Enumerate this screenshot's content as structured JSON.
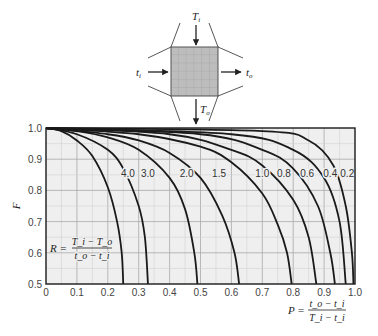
{
  "diagram": {
    "labels": {
      "top_in": "T_i",
      "bottom_out": "T_o",
      "left_in": "t_i",
      "right_out": "t_o"
    }
  },
  "chart_data": {
    "type": "line",
    "title": "",
    "xlabel": "P = (t_o − t_i) / (T_i − t_i)",
    "ylabel": "F",
    "xlim": [
      0,
      1.0
    ],
    "ylim": [
      0.5,
      1.0
    ],
    "grid": true,
    "xticks": [
      "0",
      "0.1",
      "0.2",
      "0.3",
      "0.4",
      "0.5",
      "0.6",
      "0.7",
      "0.8",
      "0.9",
      "1.0"
    ],
    "yticks": [
      "0.5",
      "0.6",
      "0.7",
      "0.8",
      "0.9",
      "1.0"
    ],
    "annotation": "R = (T_i − T_o) / (t_o − t_i)",
    "x_formula": {
      "lhs": "P =",
      "num": "t_o − t_i",
      "den": "T_i − t_i"
    },
    "r_formula": {
      "lhs": "R =",
      "num": "T_i − T_o",
      "den": "t_o − t_i"
    },
    "series": [
      {
        "name": "4.0",
        "label_pos": [
          0.265,
          0.855
        ],
        "points": [
          [
            0,
            1
          ],
          [
            0.05,
            0.99
          ],
          [
            0.1,
            0.96
          ],
          [
            0.15,
            0.91
          ],
          [
            0.2,
            0.81
          ],
          [
            0.23,
            0.7
          ],
          [
            0.245,
            0.6
          ],
          [
            0.25,
            0.5
          ]
        ]
      },
      {
        "name": "3.0",
        "label_pos": [
          0.33,
          0.855
        ],
        "points": [
          [
            0,
            1
          ],
          [
            0.1,
            0.98
          ],
          [
            0.2,
            0.93
          ],
          [
            0.25,
            0.87
          ],
          [
            0.3,
            0.75
          ],
          [
            0.32,
            0.65
          ],
          [
            0.33,
            0.5
          ]
        ]
      },
      {
        "name": "2.0",
        "label_pos": [
          0.455,
          0.855
        ],
        "points": [
          [
            0,
            1
          ],
          [
            0.1,
            0.99
          ],
          [
            0.2,
            0.97
          ],
          [
            0.3,
            0.93
          ],
          [
            0.4,
            0.84
          ],
          [
            0.45,
            0.74
          ],
          [
            0.48,
            0.6
          ],
          [
            0.49,
            0.5
          ]
        ]
      },
      {
        "name": "1.5",
        "label_pos": [
          0.56,
          0.855
        ],
        "points": [
          [
            0,
            1
          ],
          [
            0.2,
            0.98
          ],
          [
            0.3,
            0.96
          ],
          [
            0.4,
            0.92
          ],
          [
            0.5,
            0.84
          ],
          [
            0.57,
            0.72
          ],
          [
            0.61,
            0.6
          ],
          [
            0.625,
            0.5
          ]
        ]
      },
      {
        "name": "1.0",
        "label_pos": [
          0.7,
          0.855
        ],
        "points": [
          [
            0,
            1
          ],
          [
            0.3,
            0.98
          ],
          [
            0.5,
            0.94
          ],
          [
            0.6,
            0.89
          ],
          [
            0.7,
            0.79
          ],
          [
            0.75,
            0.69
          ],
          [
            0.78,
            0.6
          ],
          [
            0.795,
            0.5
          ]
        ]
      },
      {
        "name": "0.8",
        "label_pos": [
          0.77,
          0.855
        ],
        "points": [
          [
            0,
            1
          ],
          [
            0.4,
            0.98
          ],
          [
            0.6,
            0.93
          ],
          [
            0.7,
            0.88
          ],
          [
            0.8,
            0.77
          ],
          [
            0.85,
            0.65
          ],
          [
            0.875,
            0.5
          ]
        ]
      },
      {
        "name": "0.6",
        "label_pos": [
          0.845,
          0.855
        ],
        "points": [
          [
            0,
            1
          ],
          [
            0.5,
            0.98
          ],
          [
            0.7,
            0.93
          ],
          [
            0.8,
            0.87
          ],
          [
            0.88,
            0.75
          ],
          [
            0.92,
            0.6
          ],
          [
            0.935,
            0.5
          ]
        ]
      },
      {
        "name": "0.4",
        "label_pos": [
          0.92,
          0.855
        ],
        "points": [
          [
            0,
            1
          ],
          [
            0.6,
            0.98
          ],
          [
            0.8,
            0.93
          ],
          [
            0.9,
            0.84
          ],
          [
            0.95,
            0.7
          ],
          [
            0.97,
            0.5
          ]
        ]
      },
      {
        "name": "0.2",
        "label_pos": [
          0.975,
          0.855
        ],
        "points": [
          [
            0,
            1
          ],
          [
            0.7,
            0.99
          ],
          [
            0.85,
            0.96
          ],
          [
            0.93,
            0.88
          ],
          [
            0.97,
            0.75
          ],
          [
            0.99,
            0.6
          ],
          [
            0.995,
            0.5
          ]
        ]
      }
    ],
    "colors": {
      "plot_bg": "#efefef",
      "grid_major": "#a8a8a8",
      "grid_minor": "#d2d2d2",
      "curve": "#1a1a1a",
      "frame": "#1a1a1a"
    }
  }
}
